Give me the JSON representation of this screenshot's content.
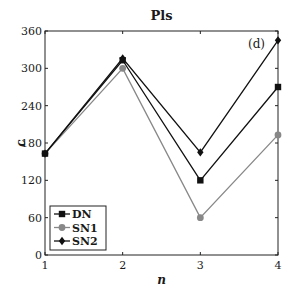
{
  "chart_data": {
    "type": "line",
    "title": "Pls",
    "xlabel": "n",
    "ylabel": "c",
    "annotation": "(d)",
    "x": [
      1,
      2,
      3,
      4
    ],
    "xticks": [
      "1",
      "2",
      "3",
      "4"
    ],
    "yticks": [
      "0",
      "60",
      "120",
      "180",
      "240",
      "300",
      "360"
    ],
    "xlim": [
      1,
      4
    ],
    "ylim": [
      0,
      360
    ],
    "grid": false,
    "legend_position": "lower-left",
    "series": [
      {
        "name": "DN",
        "marker": "square",
        "color": "#111111",
        "values": [
          163,
          313,
          120,
          270
        ]
      },
      {
        "name": "SN1",
        "marker": "circle",
        "color": "#888888",
        "values": [
          163,
          300,
          60,
          193
        ]
      },
      {
        "name": "SN2",
        "marker": "diamond",
        "color": "#111111",
        "values": [
          163,
          316,
          165,
          345
        ]
      }
    ]
  }
}
